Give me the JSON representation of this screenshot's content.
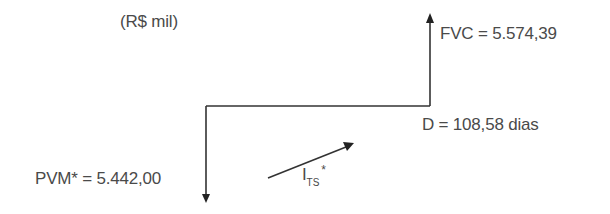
{
  "diagram": {
    "unit_label": "(R$ mil)",
    "present_value": {
      "label": "PVM* = 5.442,00",
      "name": "PVM*",
      "value": "5.442,00",
      "direction": "down"
    },
    "future_value": {
      "label": "FVC = 5.574,39",
      "name": "FVC",
      "value": "5.574,39",
      "direction": "up"
    },
    "duration": {
      "label": "D = 108,58 dias",
      "name": "D",
      "value": "108,58",
      "unit": "dias"
    },
    "rate": {
      "main": "I",
      "subscript": "TS",
      "superscript": "*"
    },
    "colors": {
      "line": "#333333",
      "text": "#4a4a4a",
      "background": "#ffffff"
    }
  }
}
